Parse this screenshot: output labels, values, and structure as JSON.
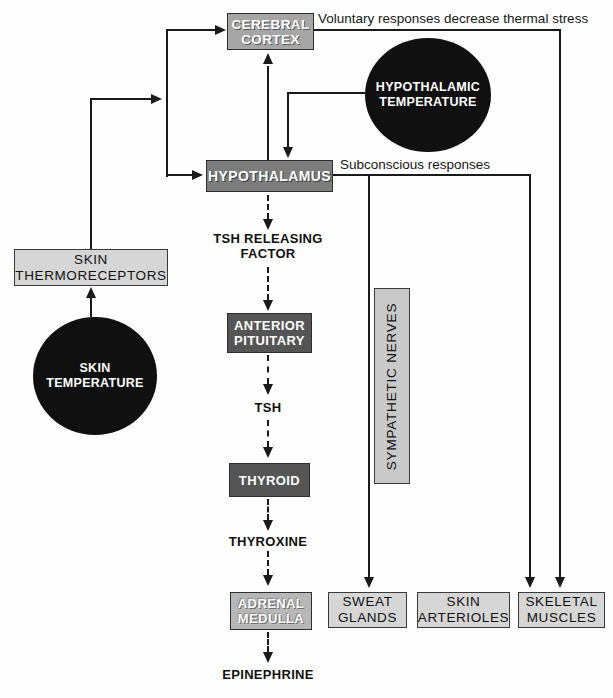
{
  "diagram": {
    "title_implicit": "Thermoregulation feedback diagram",
    "annotations": {
      "voluntary": "Voluntary responses decrease thermal stress",
      "subconscious": "Subconscious responses"
    },
    "nodes": {
      "cerebral_cortex": {
        "line1": "CEREBRAL",
        "line2": "CORTEX"
      },
      "hypothalamic_temperature": {
        "line1": "HYPOTHALAMIC",
        "line2": "TEMPERATURE"
      },
      "hypothalamus": {
        "label": "HYPOTHALAMUS"
      },
      "skin_thermoreceptors": {
        "line1": "SKIN",
        "line2": "THERMORECEPTORS"
      },
      "skin_temperature": {
        "line1": "SKIN",
        "line2": "TEMPERATURE"
      },
      "tsh_releasing_factor": {
        "line1": "TSH RELEASING",
        "line2": "FACTOR"
      },
      "anterior_pituitary": {
        "line1": "ANTERIOR",
        "line2": "PITUITARY"
      },
      "tsh": {
        "label": "TSH"
      },
      "thyroid": {
        "label": "THYROID"
      },
      "thyroxine": {
        "label": "THYROXINE"
      },
      "adrenal_medulla": {
        "line1": "ADRENAL",
        "line2": "MEDULLA"
      },
      "epinephrine": {
        "label": "EPINEPHRINE"
      },
      "sympathetic_nerves": {
        "label": "SYMPATHETIC NERVES"
      },
      "sweat_glands": {
        "line1": "SWEAT",
        "line2": "GLANDS"
      },
      "skin_arterioles": {
        "line1": "SKIN",
        "line2": "ARTERIOLES"
      },
      "skeletal_muscles": {
        "line1": "SKELETAL",
        "line2": "MUSCLES"
      }
    },
    "colors": {
      "background": "#fefefe",
      "line": "#1a1a1a",
      "box_cortex": "#a6a6a6",
      "box_hypothalamus": "#7c7c7c",
      "box_dark": "#555555",
      "box_adrenal": "#b7b7b7",
      "box_light": "#d6d6d6",
      "box_nerves": "#c9c9c9",
      "circle_fill": "#101010",
      "circle_text": "#ffffff"
    }
  }
}
